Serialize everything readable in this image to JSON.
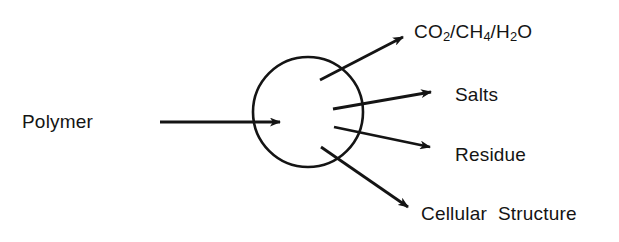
{
  "figure": {
    "type": "flow-diagram",
    "background_color": "#ffffff",
    "stroke_color": "#141414",
    "text_color": "#141414"
  },
  "nodes": {
    "input": {
      "id": "polymer",
      "label": "Polymer",
      "shape": "text",
      "x": 67,
      "y": 122
    },
    "process": {
      "id": "process-circle",
      "label": "",
      "shape": "circle",
      "cx": 308,
      "cy": 112,
      "rx": 55,
      "ry": 55
    }
  },
  "outputs": [
    {
      "id": "gases",
      "label_parts": [
        {
          "text": "CO"
        },
        {
          "text": "2",
          "sub": true
        },
        {
          "text": "/CH"
        },
        {
          "text": "4",
          "sub": true
        },
        {
          "text": "/H"
        },
        {
          "text": "2",
          "sub": true
        },
        {
          "text": "O"
        }
      ],
      "label_plain": "CO2/CH4/H2O",
      "arrow": {
        "x1": 320,
        "y1": 80,
        "x2": 412,
        "y2": 33
      }
    },
    {
      "id": "salts",
      "label_parts": [
        {
          "text": "Salts"
        }
      ],
      "label_plain": "Salts",
      "arrow": {
        "x1": 333,
        "y1": 109,
        "x2": 441,
        "y2": 91
      }
    },
    {
      "id": "residue",
      "label_parts": [
        {
          "text": "Residue"
        }
      ],
      "label_plain": "Residue",
      "arrow": {
        "x1": 334,
        "y1": 127,
        "x2": 440,
        "y2": 149
      }
    },
    {
      "id": "cellular-structure",
      "label_parts": [
        {
          "text": "Cellular  Structure"
        }
      ],
      "label_plain": "Cellular  Structure",
      "arrow": {
        "x1": 321,
        "y1": 147,
        "x2": 416,
        "y2": 213
      }
    }
  ],
  "input_arrow": {
    "x1": 160,
    "y1": 122,
    "x2": 290,
    "y2": 122
  }
}
